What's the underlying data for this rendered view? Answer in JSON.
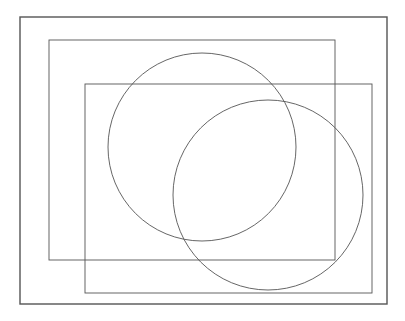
{
  "diagram": {
    "width": 405,
    "height": 321,
    "background": "#ffffff",
    "stroke_color": "#555555",
    "shapes": [
      {
        "id": "outer-frame",
        "type": "rect",
        "x": 20,
        "y": 17,
        "width": 367,
        "height": 287,
        "stroke_width": 1.4
      },
      {
        "id": "rect-a",
        "type": "rect",
        "x": 49,
        "y": 40,
        "width": 286,
        "height": 220,
        "stroke_width": 0.9
      },
      {
        "id": "rect-b",
        "type": "rect",
        "x": 85,
        "y": 84,
        "width": 287,
        "height": 209,
        "stroke_width": 0.9
      },
      {
        "id": "circle-a",
        "type": "circle",
        "cx": 202,
        "cy": 147,
        "r": 94,
        "stroke_width": 0.9
      },
      {
        "id": "circle-b",
        "type": "circle",
        "cx": 268,
        "cy": 195,
        "r": 95,
        "stroke_width": 0.9
      }
    ]
  }
}
